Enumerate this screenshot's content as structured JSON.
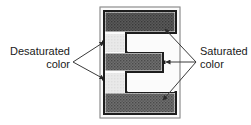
{
  "figure": {
    "background_color": "#ffffff",
    "labels": {
      "left": {
        "line1": "Desaturated",
        "line2": "color",
        "align": "right"
      },
      "right": {
        "line1": "Saturated",
        "line2": "color",
        "align": "left"
      }
    },
    "glyph": {
      "character": "E",
      "outline_color": "#1a1a1a",
      "outline_width_px": 2,
      "saturated_fill": "#6e6e6e",
      "saturated_fill_dark": "#4f4f4f",
      "desaturated_fill": "#e4e4e4",
      "interior_color": "#fafafa",
      "bars": [
        {
          "name": "top-arm",
          "fill": "saturated"
        },
        {
          "name": "upper-gap",
          "fill": "desaturated"
        },
        {
          "name": "middle-arm",
          "fill": "saturated"
        },
        {
          "name": "lower-gap",
          "fill": "desaturated"
        },
        {
          "name": "bottom-arm",
          "fill": "saturated"
        }
      ]
    },
    "leaders": {
      "color": "#3a3a3a",
      "left_vertex": "73,62",
      "right_vertex": "196,62",
      "left_targets": [
        "104,42",
        "104,78"
      ],
      "right_targets": [
        "164,29",
        "166,62",
        "163,100"
      ]
    }
  }
}
